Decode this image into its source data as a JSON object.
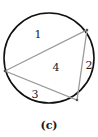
{
  "figure": {
    "caption": "(c)",
    "circle": {
      "cx": 49,
      "cy": 58,
      "r": 45,
      "stroke": "#111111"
    },
    "triangle": {
      "vertices": [
        [
          5,
          71
        ],
        [
          87,
          30
        ],
        [
          77,
          100
        ]
      ],
      "stroke": "#9a9a9a"
    },
    "regions": [
      {
        "label": "1",
        "x": 38,
        "y": 38
      },
      {
        "label": "2",
        "x": 89,
        "y": 69
      },
      {
        "label": "3",
        "x": 35,
        "y": 98
      },
      {
        "label": "4",
        "x": 56,
        "y": 71
      }
    ]
  }
}
